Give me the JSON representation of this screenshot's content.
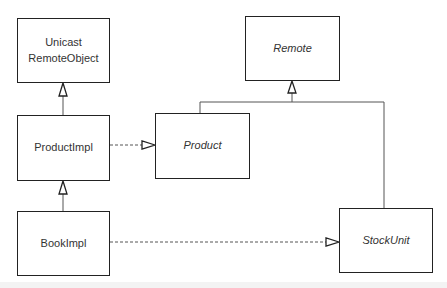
{
  "diagram": {
    "type": "uml-class-diagram",
    "classes": [
      {
        "id": "unicast",
        "label": "Unicast\nRemoteObject",
        "lines": [
          "Unicast",
          "RemoteObject"
        ],
        "abstract": false
      },
      {
        "id": "productimpl",
        "label": "ProductImpl",
        "abstract": false
      },
      {
        "id": "bookimpl",
        "label": "BookImpl",
        "abstract": false
      },
      {
        "id": "remote",
        "label": "Remote",
        "abstract": true
      },
      {
        "id": "product",
        "label": "Product",
        "abstract": true
      },
      {
        "id": "stockunit",
        "label": "StockUnit",
        "abstract": true
      }
    ],
    "relations": [
      {
        "from": "ProductImpl",
        "to": "UnicastRemoteObject",
        "kind": "generalization",
        "style": "solid"
      },
      {
        "from": "BookImpl",
        "to": "ProductImpl",
        "kind": "generalization",
        "style": "solid"
      },
      {
        "from": "ProductImpl",
        "to": "Product",
        "kind": "realization",
        "style": "dashed"
      },
      {
        "from": "BookImpl",
        "to": "StockUnit",
        "kind": "realization",
        "style": "dashed"
      },
      {
        "from": "Product",
        "to": "Remote",
        "kind": "generalization",
        "style": "solid"
      },
      {
        "from": "StockUnit",
        "to": "Remote",
        "kind": "generalization",
        "style": "solid"
      }
    ],
    "colors": {
      "stroke": "#222222",
      "connector": "#555555",
      "text": "#333333",
      "background": "#ffffff"
    }
  }
}
